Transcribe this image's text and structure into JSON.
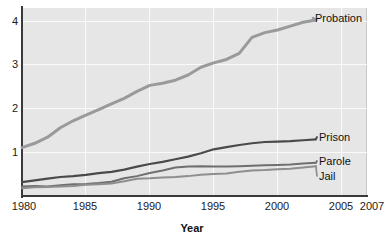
{
  "chart_data": {
    "type": "line",
    "title": "",
    "xlabel": "Year",
    "ylabel": "",
    "xlim": [
      1980,
      2007
    ],
    "ylim": [
      0,
      4.35
    ],
    "grid": true,
    "legend_position": "right-inline",
    "xticks": [
      "1980",
      "1985",
      "1990",
      "1995",
      "2000",
      "2005",
      "2007"
    ],
    "xtick_values": [
      1980,
      1985,
      1990,
      1995,
      2000,
      2005,
      2007
    ],
    "yticks": [
      "1",
      "2",
      "3",
      "4"
    ],
    "ytick_values": [
      1,
      2,
      3,
      4
    ],
    "x": [
      1980,
      1981,
      1982,
      1983,
      1984,
      1985,
      1986,
      1987,
      1988,
      1989,
      1990,
      1991,
      1992,
      1993,
      1994,
      1995,
      1996,
      1997,
      1998,
      1999,
      2000,
      2001,
      2002,
      2003
    ],
    "series": [
      {
        "name": "Probation",
        "color": "#9a9a9a",
        "values": [
          1.12,
          1.22,
          1.36,
          1.58,
          1.74,
          1.87,
          2.0,
          2.13,
          2.26,
          2.42,
          2.56,
          2.61,
          2.68,
          2.8,
          2.98,
          3.08,
          3.16,
          3.3,
          3.67,
          3.78,
          3.84,
          3.93,
          4.02,
          4.07
        ]
      },
      {
        "name": "Prison",
        "color": "#4a4a4a",
        "values": [
          0.32,
          0.36,
          0.4,
          0.44,
          0.46,
          0.49,
          0.53,
          0.56,
          0.61,
          0.68,
          0.74,
          0.79,
          0.85,
          0.91,
          0.99,
          1.08,
          1.13,
          1.18,
          1.22,
          1.25,
          1.26,
          1.27,
          1.29,
          1.31
        ]
      },
      {
        "name": "Parole",
        "color": "#6f6f6f",
        "values": [
          0.22,
          0.23,
          0.22,
          0.25,
          0.27,
          0.28,
          0.3,
          0.33,
          0.41,
          0.46,
          0.53,
          0.59,
          0.66,
          0.68,
          0.69,
          0.68,
          0.68,
          0.69,
          0.7,
          0.71,
          0.72,
          0.73,
          0.75,
          0.77
        ]
      },
      {
        "name": "Jail",
        "color": "#8e8e8e",
        "values": [
          0.18,
          0.2,
          0.21,
          0.22,
          0.23,
          0.26,
          0.27,
          0.29,
          0.34,
          0.4,
          0.41,
          0.43,
          0.44,
          0.46,
          0.49,
          0.51,
          0.52,
          0.56,
          0.59,
          0.6,
          0.62,
          0.63,
          0.66,
          0.69
        ]
      }
    ],
    "series_labels": [
      {
        "name": "Probation",
        "top": 12,
        "left": 315
      },
      {
        "name": "Prison",
        "top": 131,
        "left": 319
      },
      {
        "name": "Parole",
        "top": 155,
        "left": 319
      },
      {
        "name": "Jail",
        "top": 170,
        "left": 319
      }
    ]
  },
  "colors": {
    "plot_background": "#e6e6e6",
    "page_background": "#ffffff",
    "axis": "#3a3a3a",
    "gridline": "#fafafa",
    "text": "#111111"
  }
}
